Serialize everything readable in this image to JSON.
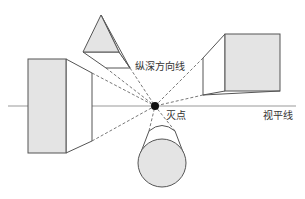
{
  "diagram": {
    "labels": {
      "depth_lines": "纵深方向线",
      "vanishing_point": "灭点",
      "horizon_line": "视平线"
    },
    "colors": {
      "stroke": "#555555",
      "face_fill": "#e4e4e4",
      "side_fill": "#ffffff",
      "dashed": "#555555",
      "vanishing_point": "#111111",
      "horizon": "#888888"
    },
    "objects": [
      {
        "name": "left-box",
        "shape": "rectangular prism"
      },
      {
        "name": "top-pyramid",
        "shape": "triangular prism"
      },
      {
        "name": "right-cube",
        "shape": "cube"
      },
      {
        "name": "bottom-cylinder",
        "shape": "cylinder"
      }
    ]
  }
}
